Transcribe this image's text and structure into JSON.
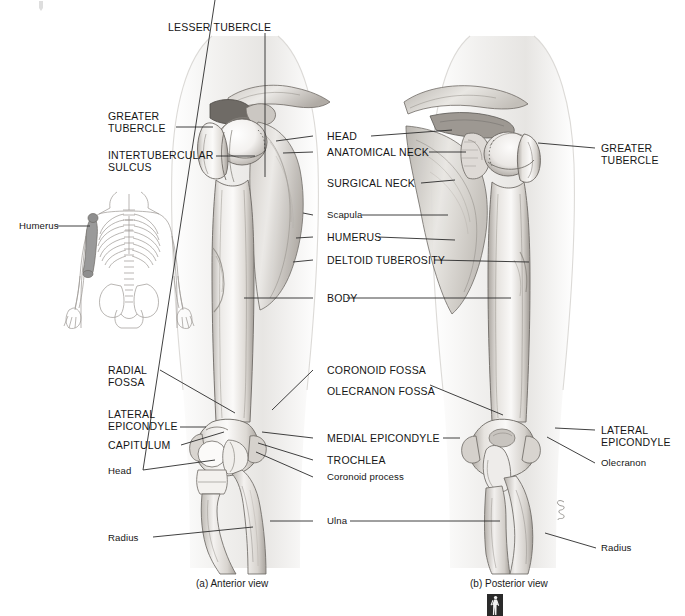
{
  "figure": {
    "captions": [
      {
        "id": "caption-a",
        "text": "(a) Anterior view"
      },
      {
        "id": "caption-b",
        "text": "(b) Posterior view"
      }
    ],
    "artist_signature": "Sherwin"
  },
  "orientation_figure": {
    "name": "skeleton-orientation-figure",
    "label": "Humerus",
    "highlight_color": "#9a9a9a",
    "outline_color": "#8a8a8a"
  },
  "labels_left": [
    {
      "id": "greater-tubercle-left",
      "text": "GREATER\nTUBERCLE",
      "style": "caps"
    },
    {
      "id": "intertubercular-sulcus",
      "text": "INTERTUBERCULAR\nSULCUS",
      "style": "caps"
    },
    {
      "id": "radial-fossa",
      "text": "RADIAL\nFOSSA",
      "style": "caps"
    },
    {
      "id": "lateral-epicondyle-left",
      "text": "LATERAL\nEPICONDYLE",
      "style": "caps"
    },
    {
      "id": "capitulum",
      "text": "CAPITULUM",
      "style": "caps"
    },
    {
      "id": "head-radius-left",
      "text": "Head",
      "style": "minor"
    },
    {
      "id": "radius-left",
      "text": "Radius",
      "style": "minor"
    }
  ],
  "labels_top": [
    {
      "id": "lesser-tubercle",
      "text": "LESSER TUBERCLE",
      "style": "caps"
    }
  ],
  "labels_center": [
    {
      "id": "head",
      "text": "HEAD",
      "style": "caps"
    },
    {
      "id": "anatomical-neck",
      "text": "ANATOMICAL NECK",
      "style": "caps"
    },
    {
      "id": "surgical-neck",
      "text": "SURGICAL NECK",
      "style": "caps"
    },
    {
      "id": "scapula",
      "text": "Scapula",
      "style": "minor"
    },
    {
      "id": "humerus",
      "text": "HUMERUS",
      "style": "caps"
    },
    {
      "id": "deltoid-tuberosity",
      "text": "DELTOID TUBEROSITY",
      "style": "caps"
    },
    {
      "id": "body",
      "text": "BODY",
      "style": "caps"
    },
    {
      "id": "coronoid-fossa",
      "text": "CORONOID FOSSA",
      "style": "caps"
    },
    {
      "id": "olecranon-fossa",
      "text": "OLECRANON FOSSA",
      "style": "caps"
    },
    {
      "id": "medial-epicondyle",
      "text": "MEDIAL EPICONDYLE",
      "style": "caps"
    },
    {
      "id": "trochlea",
      "text": "TROCHLEA",
      "style": "caps"
    },
    {
      "id": "coronoid-process",
      "text": "Coronoid process",
      "style": "minor"
    },
    {
      "id": "ulna",
      "text": "Ulna",
      "style": "minor"
    }
  ],
  "labels_right": [
    {
      "id": "greater-tubercle-right",
      "text": "GREATER\nTUBERCLE",
      "style": "caps"
    },
    {
      "id": "lateral-epicondyle-right",
      "text": "LATERAL\nEPICONDYLE",
      "style": "caps"
    },
    {
      "id": "olecranon",
      "text": "Olecranon",
      "style": "minor"
    },
    {
      "id": "radius-right",
      "text": "Radius",
      "style": "minor"
    }
  ],
  "colors": {
    "ink": "#161616",
    "leader": "#2b2b2b",
    "bone_light": "#f2f1ef",
    "bone_mid": "#d9d7d3",
    "bone_dark": "#a9a5a0",
    "shadow": "#8c8882",
    "body_tint": "#efeeec"
  }
}
